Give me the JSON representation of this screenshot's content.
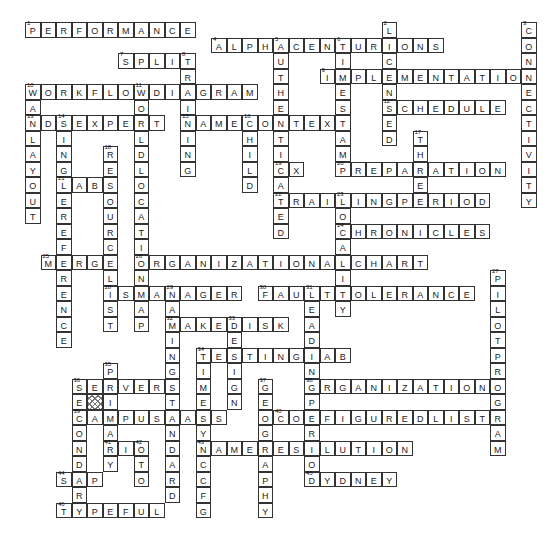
{
  "puzzle": {
    "type": "crossword",
    "grid_origin": {
      "x": 25,
      "y": 22
    },
    "cell_size": 15.5,
    "hatched_cells": [
      {
        "row": 24,
        "col": 4
      }
    ],
    "entries": [
      {
        "num": 1,
        "dir": "across",
        "row": 0,
        "col": 0,
        "answer": "PERFORMANCE"
      },
      {
        "num": 2,
        "dir": "down",
        "row": 0,
        "col": 23,
        "answer": "LICENSED"
      },
      {
        "num": 3,
        "dir": "down",
        "row": 0,
        "col": 32,
        "answer": "CONNECTIVITY"
      },
      {
        "num": 4,
        "dir": "across",
        "row": 1,
        "col": 12,
        "answer": "ALPHACENTURIONS"
      },
      {
        "num": 5,
        "dir": "down",
        "row": 1,
        "col": 16,
        "answer": "AUTHENTICATED"
      },
      {
        "num": 6,
        "dir": "down",
        "row": 1,
        "col": 20,
        "answer": "TIMESTAMP"
      },
      {
        "num": 7,
        "dir": "across",
        "row": 2,
        "col": 6,
        "answer": "SPLIT"
      },
      {
        "num": 8,
        "dir": "down",
        "row": 2,
        "col": 10,
        "answer": "TRAINING"
      },
      {
        "num": 9,
        "dir": "across",
        "row": 3,
        "col": 19,
        "answer": "IMPLEMENTATION"
      },
      {
        "num": 10,
        "dir": "across",
        "row": 4,
        "col": 0,
        "answer": "WORKFLOWDIAGRAM"
      },
      {
        "num": 10,
        "dir": "down",
        "row": 4,
        "col": 0,
        "answer": "WANLAYOUT"
      },
      {
        "num": 11,
        "dir": "down",
        "row": 4,
        "col": 7,
        "answer": "WORLDLOCATION"
      },
      {
        "num": 12,
        "dir": "across",
        "row": 5,
        "col": 23,
        "answer": "SCHEDULE"
      },
      {
        "num": 13,
        "dir": "across",
        "row": 6,
        "col": 0,
        "answer": "NDSEXPERT"
      },
      {
        "num": 14,
        "dir": "down",
        "row": 6,
        "col": 2,
        "answer": "SINGLEREFERENCE"
      },
      {
        "num": 15,
        "dir": "across",
        "row": 6,
        "col": 10,
        "answer": "NAMECONTEXT"
      },
      {
        "num": 16,
        "dir": "down",
        "row": 6,
        "col": 14,
        "answer": "CHILD"
      },
      {
        "num": 17,
        "dir": "down",
        "row": 7,
        "col": 25,
        "answer": "THREE"
      },
      {
        "num": 18,
        "dir": "down",
        "row": 8,
        "col": 5,
        "answer": "RESOURCELIST"
      },
      {
        "num": 19,
        "dir": "across",
        "row": 9,
        "col": 16,
        "answer": "CX"
      },
      {
        "num": 20,
        "dir": "across",
        "row": 9,
        "col": 20,
        "answer": "PREPARATION"
      },
      {
        "num": 21,
        "dir": "across",
        "row": 10,
        "col": 2,
        "answer": "LABS"
      },
      {
        "num": 22,
        "dir": "across",
        "row": 11,
        "col": 16,
        "answer": "TRAILINGPERIOD"
      },
      {
        "num": 23,
        "dir": "down",
        "row": 11,
        "col": 20,
        "answer": "LOCALITY"
      },
      {
        "num": 24,
        "dir": "across",
        "row": 13,
        "col": 20,
        "answer": "CHRONICLES"
      },
      {
        "num": 25,
        "dir": "across",
        "row": 15,
        "col": 1,
        "answer": "MERGE"
      },
      {
        "num": 26,
        "dir": "across",
        "row": 15,
        "col": 7,
        "answer": "ORGANIZATIONALCHART"
      },
      {
        "num": 26,
        "dir": "down",
        "row": 15,
        "col": 7,
        "answer": "ONMAP"
      },
      {
        "num": 27,
        "dir": "down",
        "row": 16,
        "col": 30,
        "answer": "PILOTPROGRAM"
      },
      {
        "num": 28,
        "dir": "across",
        "row": 17,
        "col": 5,
        "answer": "ISMANAGER"
      },
      {
        "num": 29,
        "dir": "down",
        "row": 17,
        "col": 9,
        "answer": "NAMINGSTANDARD"
      },
      {
        "num": 30,
        "dir": "across",
        "row": 17,
        "col": 15,
        "answer": "FAULTTOLERANCE"
      },
      {
        "num": 31,
        "dir": "down",
        "row": 17,
        "col": 18,
        "answer": "LEADINGPERIOD"
      },
      {
        "num": 32,
        "dir": "across",
        "row": 19,
        "col": 9,
        "answer": "MAKEDISK"
      },
      {
        "num": 33,
        "dir": "down",
        "row": 19,
        "col": 13,
        "answer": "DESIGN"
      },
      {
        "num": 34,
        "dir": "across",
        "row": 21,
        "col": 11,
        "answer": "TESTINGLAB"
      },
      {
        "num": 34,
        "dir": "down",
        "row": 21,
        "col": 11,
        "answer": "TIMESYNCCFG"
      },
      {
        "num": 35,
        "dir": "down",
        "row": 22,
        "col": 5,
        "answer": "PRIMARY"
      },
      {
        "num": 36,
        "dir": "across",
        "row": 23,
        "col": 3,
        "answer": "SERVER"
      },
      {
        "num": 36,
        "dir": "down",
        "row": 23,
        "col": 3,
        "answer": "SECONDARY"
      },
      {
        "num": 37,
        "dir": "down",
        "row": 23,
        "col": 15,
        "answer": "GEOGRAPHY"
      },
      {
        "num": 38,
        "dir": "across",
        "row": 23,
        "col": 18,
        "answer": "ORGANIZATION"
      },
      {
        "num": 39,
        "dir": "across",
        "row": 25,
        "col": 3,
        "answer": "CAMPUSMAPS"
      },
      {
        "num": 40,
        "dir": "across",
        "row": 25,
        "col": 16,
        "answer": "CONFIGUREDLIST"
      },
      {
        "num": 41,
        "dir": "across",
        "row": 27,
        "col": 5,
        "answer": "RIO"
      },
      {
        "num": 42,
        "dir": "down",
        "row": 27,
        "col": 7,
        "answer": "OTO"
      },
      {
        "num": 43,
        "dir": "across",
        "row": 27,
        "col": 11,
        "answer": "NAMERESOLUTION"
      },
      {
        "num": 44,
        "dir": "across",
        "row": 29,
        "col": 2,
        "answer": "SAP"
      },
      {
        "num": 45,
        "dir": "across",
        "row": 29,
        "col": 18,
        "answer": "SYDNEY"
      },
      {
        "num": 46,
        "dir": "across",
        "row": 31,
        "col": 2,
        "answer": "TYPEFUL"
      }
    ]
  }
}
